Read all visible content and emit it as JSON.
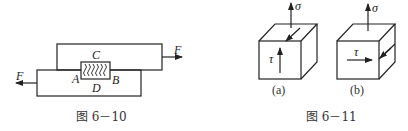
{
  "figures": [
    {
      "id": "fig-6-10",
      "caption": "图 6－10",
      "labels": {
        "top": "C",
        "left": "A",
        "right": "B",
        "bottom": "D",
        "force_right": "F",
        "force_left": "F"
      }
    },
    {
      "id": "fig-6-11",
      "caption": "图 6－11",
      "panels": [
        {
          "label": "(a)",
          "sigma": "σ",
          "tau": "τ"
        },
        {
          "label": "(b)",
          "sigma": "σ",
          "tau": "τ"
        }
      ]
    }
  ]
}
